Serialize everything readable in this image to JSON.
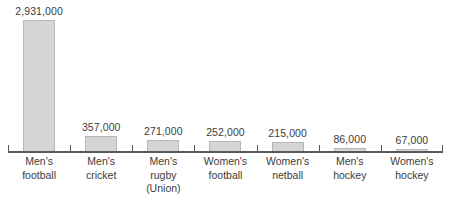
{
  "chart_data": {
    "type": "bar",
    "title": "",
    "subtitle": "",
    "xlabel": "",
    "ylabel": "",
    "ylim": [
      0,
      3100000
    ],
    "grid": false,
    "legend": null,
    "axis": {
      "baseline_visible": true,
      "ticks_visible": true,
      "value_labels_visible": true
    },
    "categories": [
      "Men's football",
      "Men's cricket",
      "Men's rugby (Union)",
      "Women's football",
      "Women's netball",
      "Men's hockey",
      "Women's hockey"
    ],
    "category_lines": [
      [
        "Men's",
        "football"
      ],
      [
        "Men's",
        "cricket"
      ],
      [
        "Men's",
        "rugby",
        "(Union)"
      ],
      [
        "Women's",
        "football"
      ],
      [
        "Women's",
        "netball"
      ],
      [
        "Men's",
        "hockey"
      ],
      [
        "Women's",
        "hockey"
      ]
    ],
    "values": [
      2931000,
      357000,
      271000,
      252000,
      215000,
      86000,
      67000
    ],
    "value_labels": [
      "2,931,000",
      "357,000",
      "271,000",
      "252,000",
      "215,000",
      "86,000",
      "67,000"
    ],
    "colors": {
      "bar_fill": "#d5d5d5",
      "bar_border": "#b6b6b6",
      "axis": "#595959",
      "text": "#3c3c3c",
      "background": "#ffffff"
    }
  }
}
